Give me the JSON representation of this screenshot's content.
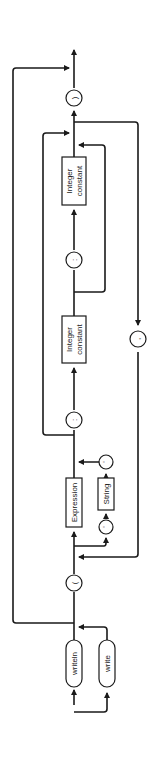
{
  "diagram": {
    "type": "syntax-diagram",
    "orientation": "rotated-90-ccw",
    "colors": {
      "line": "#1a1a1a",
      "background": "#ffffff"
    },
    "keywords": [
      {
        "id": "writeln",
        "label": "writeln"
      },
      {
        "id": "write",
        "label": "write"
      }
    ],
    "symbols": {
      "open_paren": "(",
      "close_paren": ")",
      "colon_1": ":",
      "colon_2": ":",
      "comma": ",",
      "quote_open": "'",
      "quote_close": "'"
    },
    "boxes": {
      "expression": "Expression",
      "string": "String",
      "integer_constant_1_line1": "Integer",
      "integer_constant_1_line2": "constant",
      "integer_constant_2_line1": "Integer",
      "integer_constant_2_line2": "constant"
    },
    "flow": [
      "writeln | write",
      "(",
      "Expression | ' String '",
      "[ : Integer constant [ : Integer constant ] ]",
      "{ , repeat }",
      ")"
    ]
  }
}
